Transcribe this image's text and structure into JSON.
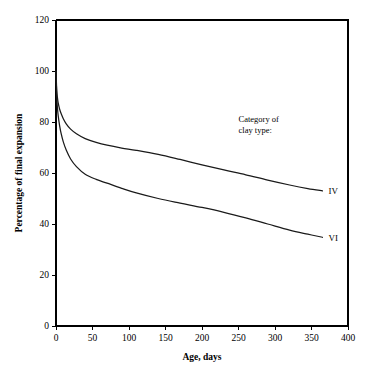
{
  "chart_data": {
    "type": "line",
    "title": "",
    "xlabel": "Age, days",
    "ylabel": "Percentage of final expansion",
    "xlim": [
      0,
      400
    ],
    "ylim": [
      0,
      120
    ],
    "xticks": [
      0,
      50,
      100,
      150,
      200,
      250,
      300,
      350,
      400
    ],
    "yticks": [
      0,
      20,
      40,
      60,
      80,
      100,
      120
    ],
    "xtick_labels": [
      "0",
      "50",
      "100",
      "150",
      "200",
      "250",
      "300",
      "350",
      "400"
    ],
    "ytick_labels": [
      "0",
      "20",
      "40",
      "60",
      "80",
      "100",
      "120"
    ],
    "grid": false,
    "legend_position": "inline-right-end-of-curves",
    "annotations": [
      {
        "name": "category-note",
        "lines": [
          "Category of",
          "clay type:"
        ],
        "x": 250,
        "y": 80
      }
    ],
    "series": [
      {
        "name": "IV",
        "label": "IV",
        "x": [
          0,
          1,
          2,
          3,
          5,
          7,
          10,
          14,
          20,
          28,
          40,
          55,
          70,
          90,
          110,
          140,
          170,
          200,
          230,
          260,
          290,
          320,
          345,
          365
        ],
        "y": [
          100,
          92.5,
          89.5,
          87.5,
          85.0,
          83.3,
          81.3,
          79.3,
          77.2,
          75.4,
          73.5,
          72.0,
          70.9,
          69.8,
          68.9,
          67.3,
          65.3,
          63.2,
          61.2,
          59.3,
          57.2,
          55.3,
          53.9,
          53.0
        ]
      },
      {
        "name": "VI",
        "label": "VI",
        "x": [
          0,
          1,
          2,
          3,
          5,
          7,
          10,
          14,
          20,
          28,
          40,
          55,
          70,
          90,
          110,
          140,
          170,
          200,
          230,
          260,
          290,
          320,
          345,
          365
        ],
        "y": [
          100,
          90.0,
          85.5,
          82.5,
          78.5,
          75.5,
          72.2,
          69.0,
          65.5,
          62.5,
          59.5,
          57.5,
          56.0,
          54.0,
          52.2,
          50.0,
          48.2,
          46.5,
          44.6,
          42.4,
          40.0,
          37.6,
          36.0,
          34.8
        ]
      }
    ],
    "series_end_labels": [
      {
        "series": "IV",
        "label": "IV"
      },
      {
        "series": "VI",
        "label": "VI"
      }
    ],
    "colors": {
      "curve": "#1a1a1a",
      "axis": "#000000",
      "background": "#ffffff"
    }
  }
}
